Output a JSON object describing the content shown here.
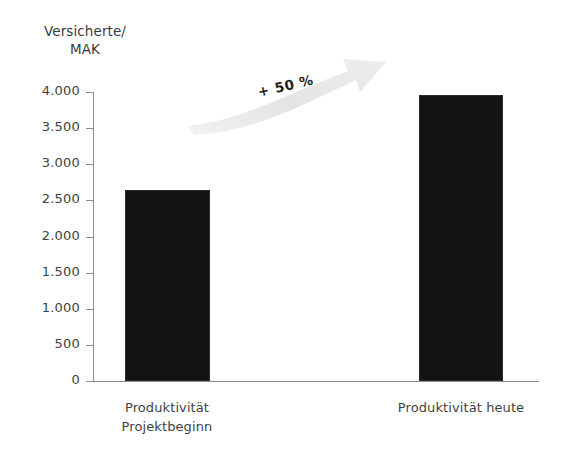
{
  "chart_data": {
    "type": "bar",
    "title": "",
    "subtitle": "",
    "xlabel": "",
    "ylabel": "Versicherte/ MAK",
    "ylabel_line1": "Versicherte/",
    "ylabel_line2": "MAK",
    "categories": [
      "Produktivität Projektbeginn",
      "Produktivität heute"
    ],
    "category_lines": [
      [
        "Produktivität",
        "Projektbeginn"
      ],
      [
        "Produktivität heute",
        ""
      ]
    ],
    "values": [
      2650,
      3960
    ],
    "ylim": [
      0,
      4000
    ],
    "ytick_values": [
      0,
      500,
      1000,
      1500,
      2000,
      2500,
      3000,
      3500,
      4000
    ],
    "ytick_labels": [
      "0",
      "500",
      "1.000",
      "1.500",
      "2.000",
      "2.500",
      "3.000",
      "3.500",
      "4.000"
    ],
    "grid": false,
    "legend": "none",
    "bar_color": "#131313",
    "axis_color": "#8c8c8c",
    "text_color": "#3f3f3f",
    "background": "#ffffff",
    "annotations": [
      {
        "name": "growth-arrow",
        "text": "+ 50 %",
        "shape": "arrow",
        "direction": "up-right",
        "color": "#e6e6e6",
        "text_color": "#1d1d1d",
        "rotation_deg": -13
      }
    ]
  }
}
